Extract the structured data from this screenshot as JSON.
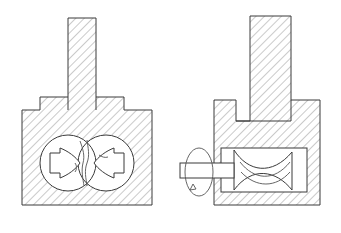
{
  "figure": {
    "title": "Cross-section of a twin-rotor pump housing",
    "background_color": "#ffffff",
    "line_color": "#3a3a3a",
    "hatch_color": "#8a8a8a",
    "hatch_angle_degrees": 45,
    "views": [
      {
        "id": "left-view",
        "name": "front-section-view",
        "label": "",
        "features": [
          {
            "name": "upper-port-stem",
            "shape": "vertical-rectangle"
          },
          {
            "name": "left-flange-shoulder",
            "shape": "step"
          },
          {
            "name": "right-flange-shoulder",
            "shape": "step"
          },
          {
            "name": "main-body-block",
            "shape": "hatched-block"
          },
          {
            "name": "left-rotor-bore",
            "shape": "circle"
          },
          {
            "name": "right-rotor-bore",
            "shape": "circle"
          },
          {
            "name": "left-rotor-lobe",
            "shape": "bowtie-lobe"
          },
          {
            "name": "right-rotor-lobe",
            "shape": "bowtie-lobe"
          }
        ]
      },
      {
        "id": "right-view",
        "name": "side-section-view",
        "label": "",
        "features": [
          {
            "name": "upper-port-stem",
            "shape": "vertical-rectangle"
          },
          {
            "name": "left-flange-shoulder",
            "shape": "step"
          },
          {
            "name": "right-flange-shoulder",
            "shape": "step"
          },
          {
            "name": "main-body-block",
            "shape": "hatched-block"
          },
          {
            "name": "internal-cavity",
            "shape": "rectangle"
          },
          {
            "name": "rotor-wave-profile",
            "shape": "wavy-band"
          },
          {
            "name": "drive-shaft",
            "shape": "horizontal-bar"
          },
          {
            "name": "rotation-indicator-ellipse",
            "shape": "ellipse-arrow"
          }
        ]
      }
    ]
  }
}
